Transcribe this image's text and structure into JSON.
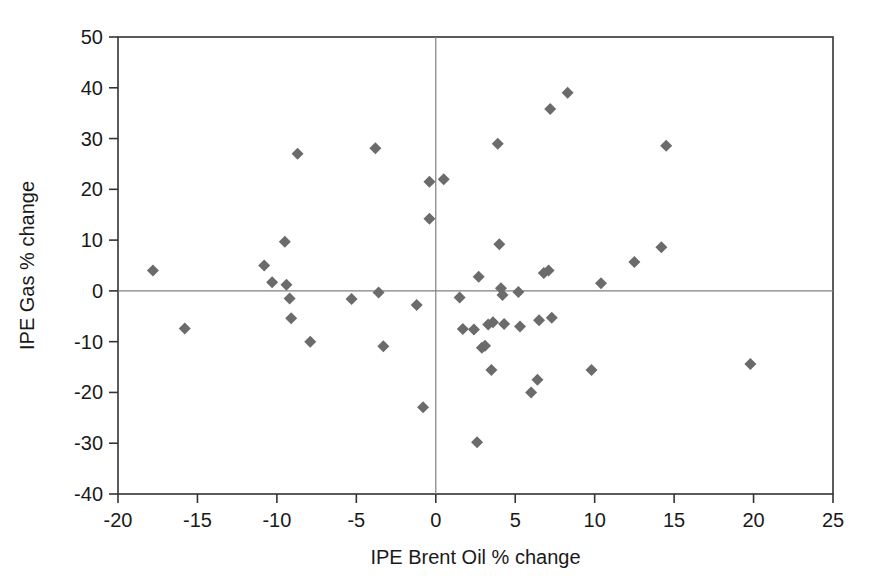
{
  "chart_data": {
    "type": "scatter",
    "title": "",
    "xlabel": "IPE Brent Oil % change",
    "ylabel": "IPE Gas  % change",
    "xlim": [
      -20,
      25
    ],
    "ylim": [
      -40,
      50
    ],
    "xticks": [
      -20,
      -15,
      -10,
      -5,
      0,
      5,
      10,
      15,
      20,
      25
    ],
    "xtick_labels": [
      "-20",
      "-15",
      "-10",
      "-5",
      "0",
      "5",
      "10",
      "15",
      "20",
      "25"
    ],
    "yticks": [
      -40,
      -30,
      -20,
      -10,
      0,
      10,
      20,
      30,
      40,
      50
    ],
    "ytick_labels": [
      "-40",
      "-30",
      "-20",
      "-10",
      "0",
      "10",
      "20",
      "30",
      "40",
      "50"
    ],
    "grid": false,
    "zero_lines": true,
    "legend": null,
    "marker": "diamond",
    "marker_color": "#6b6b6b",
    "marker_size": 9,
    "axis_color": "#333333",
    "background": "#ffffff",
    "series": [
      {
        "name": "Monthly % change",
        "points": [
          [
            -17.8,
            4.0
          ],
          [
            -15.8,
            -7.4
          ],
          [
            -10.8,
            5.0
          ],
          [
            -10.3,
            1.7
          ],
          [
            -9.5,
            9.7
          ],
          [
            -9.4,
            1.2
          ],
          [
            -9.2,
            -1.5
          ],
          [
            -9.1,
            -5.4
          ],
          [
            -8.7,
            27.0
          ],
          [
            -7.9,
            -10.0
          ],
          [
            -5.3,
            -1.6
          ],
          [
            -3.8,
            28.1
          ],
          [
            -3.6,
            -0.3
          ],
          [
            -3.3,
            -10.9
          ],
          [
            -1.2,
            -2.8
          ],
          [
            -0.8,
            -22.9
          ],
          [
            -0.4,
            21.5
          ],
          [
            -0.4,
            14.2
          ],
          [
            0.5,
            22.0
          ],
          [
            1.5,
            -1.3
          ],
          [
            1.7,
            -7.5
          ],
          [
            2.4,
            -7.6
          ],
          [
            2.6,
            -29.8
          ],
          [
            2.7,
            2.8
          ],
          [
            2.9,
            -11.2
          ],
          [
            3.1,
            -10.8
          ],
          [
            3.3,
            -6.6
          ],
          [
            3.5,
            -15.6
          ],
          [
            3.6,
            -6.2
          ],
          [
            3.9,
            29.0
          ],
          [
            4.0,
            9.2
          ],
          [
            4.1,
            0.5
          ],
          [
            4.2,
            -0.8
          ],
          [
            4.3,
            -6.5
          ],
          [
            5.2,
            -0.2
          ],
          [
            5.3,
            -7.0
          ],
          [
            6.0,
            -20.0
          ],
          [
            6.4,
            -17.5
          ],
          [
            6.5,
            -5.8
          ],
          [
            6.8,
            3.5
          ],
          [
            7.1,
            4.0
          ],
          [
            7.2,
            35.8
          ],
          [
            7.3,
            -5.3
          ],
          [
            8.3,
            39.0
          ],
          [
            9.8,
            -15.6
          ],
          [
            10.4,
            1.5
          ],
          [
            12.5,
            5.7
          ],
          [
            14.2,
            8.6
          ],
          [
            14.5,
            28.6
          ],
          [
            19.8,
            -14.4
          ]
        ]
      }
    ]
  }
}
